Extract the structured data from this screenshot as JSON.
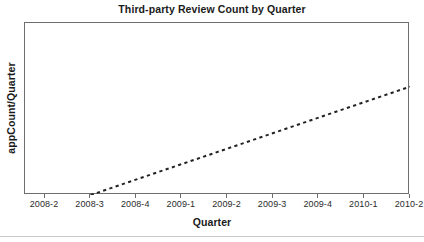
{
  "chart_data": {
    "type": "line",
    "title": "Third-party Review Count by Quarter",
    "xlabel": "Quarter",
    "ylabel": "appCount/Quarter",
    "categories": [
      "2008-2",
      "2008-3",
      "2008-4",
      "2009-1",
      "2009-2",
      "2009-3",
      "2009-4",
      "2010-1",
      "2010-2"
    ],
    "series": [
      {
        "name": "appCount/Quarter trend",
        "style": "dashed",
        "color": "#222222",
        "x": [
          "2008-3",
          "2010-2"
        ],
        "values": [
          0,
          63
        ]
      }
    ],
    "ylim": [
      0,
      100
    ],
    "y_ticks_visible": false,
    "y_tick_labels": [],
    "grid": false,
    "legend": false,
    "frame": true
  },
  "axes": {
    "x_tick_labels": [
      "2008-2",
      "2008-3",
      "2008-4",
      "2009-1",
      "2009-2",
      "2009-3",
      "2009-4",
      "2010-1",
      "2010-2"
    ]
  },
  "colors": {
    "frame": "#6e6e6e",
    "line": "#222222",
    "text": "#1a1a1a",
    "tick_text": "#2b2b2b",
    "background": "#ffffff",
    "bottom_rule": "#c9c9c9"
  }
}
